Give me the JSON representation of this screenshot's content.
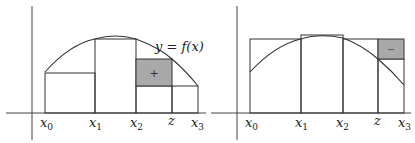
{
  "left_panel": {
    "curve_label": "y = f(x)",
    "ticks": [
      {
        "main": "x",
        "sub": "0"
      },
      {
        "main": "x",
        "sub": "1"
      },
      {
        "main": "x",
        "sub": "2"
      },
      {
        "main": "z",
        "sub": ""
      },
      {
        "main": "x",
        "sub": "3"
      }
    ],
    "shaded_sign": "+"
  },
  "right_panel": {
    "ticks": [
      {
        "main": "x",
        "sub": "0"
      },
      {
        "main": "x",
        "sub": "1"
      },
      {
        "main": "x",
        "sub": "2"
      },
      {
        "main": "z",
        "sub": ""
      },
      {
        "main": "x",
        "sub": "3"
      }
    ],
    "shaded_sign": "−"
  },
  "colors": {
    "line": "#333333",
    "shade": "#a9a9a9",
    "axis": "#444444"
  }
}
